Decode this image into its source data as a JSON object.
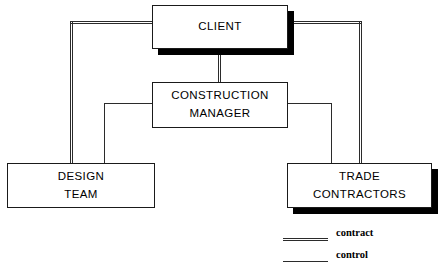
{
  "diagram": {
    "type": "organizational-chart",
    "nodes": [
      {
        "id": "client",
        "lines": [
          "CLIENT"
        ],
        "x": 152,
        "y": 5,
        "width": 136,
        "height": 44,
        "shadow": true
      },
      {
        "id": "construction-manager",
        "lines": [
          "CONSTRUCTION",
          "MANAGER"
        ],
        "x": 152,
        "y": 82,
        "width": 136,
        "height": 46,
        "shadow": false
      },
      {
        "id": "design-team",
        "lines": [
          "DESIGN",
          "TEAM"
        ],
        "x": 7,
        "y": 163,
        "width": 148,
        "height": 45,
        "shadow": false
      },
      {
        "id": "trade-contractors",
        "lines": [
          "TRADE",
          "CONTRACTORS"
        ],
        "x": 287,
        "y": 163,
        "width": 145,
        "height": 45,
        "shadow": true
      }
    ],
    "relationships": [
      {
        "id": "client-design-team",
        "kind": "contract",
        "from": "client",
        "to": "design-team"
      },
      {
        "id": "client-construction-manager",
        "kind": "contract",
        "from": "client",
        "to": "construction-manager"
      },
      {
        "id": "client-trade-contractors",
        "kind": "contract",
        "from": "client",
        "to": "trade-contractors"
      },
      {
        "id": "manager-design-team",
        "kind": "control",
        "from": "construction-manager",
        "to": "design-team"
      },
      {
        "id": "manager-trade-contractors",
        "kind": "control",
        "from": "construction-manager",
        "to": "trade-contractors"
      }
    ]
  },
  "legend": {
    "items": [
      {
        "id": "contract",
        "label": "contract",
        "style": "double-line"
      },
      {
        "id": "control",
        "label": "control",
        "style": "single-line"
      }
    ]
  },
  "colors": {
    "line": "#2b2b2b",
    "border": "#1a1a1a",
    "shadow": "#000000",
    "background": "#ffffff",
    "text": "#000000"
  }
}
